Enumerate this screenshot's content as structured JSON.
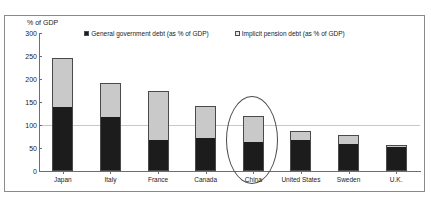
{
  "chart_data": {
    "type": "bar",
    "title": "",
    "subtitle": "",
    "xlabel": "",
    "ylabel": "% of GDP",
    "ylim": [
      0,
      300
    ],
    "ytick_values": [
      0,
      50,
      100,
      150,
      200,
      250,
      300
    ],
    "ytick_labels": [
      "0",
      "50",
      "100",
      "150",
      "200",
      "250",
      "300"
    ],
    "grid": "horizontal gridline at 100",
    "gridlines": [
      100
    ],
    "stacked": true,
    "legend_position": "top-center",
    "categories": [
      "Japan",
      "Italy",
      "France",
      "Canada",
      "China",
      "United States",
      "Sweden",
      "U.K."
    ],
    "series": [
      {
        "name": "General government debt (as % of GDP)",
        "color": "#1c1c1c",
        "values": [
          140,
          118,
          68,
          72,
          63,
          68,
          58,
          52
        ]
      },
      {
        "name": "Implicit pension debt (as % of GDP)",
        "color": "#c9c9c9",
        "values": [
          105,
          74,
          107,
          70,
          57,
          19,
          20,
          5
        ]
      }
    ],
    "totals": [
      245,
      192,
      175,
      142,
      120,
      87,
      78,
      57
    ],
    "annotations": [
      {
        "type": "ellipse",
        "target": "China",
        "label": ""
      }
    ]
  },
  "axis": {
    "y_title": "% of GDP"
  },
  "legend": {
    "items": [
      {
        "label": "General government debt (as % of GDP)",
        "swatch": "dark-square-marker"
      },
      {
        "label": "Implicit pension debt (as % of GDP)",
        "swatch": "light-square-marker"
      }
    ]
  }
}
